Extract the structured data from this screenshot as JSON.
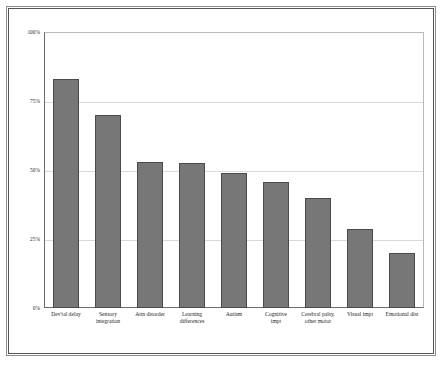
{
  "chart_data": {
    "type": "bar",
    "title": "",
    "subtitle": "",
    "xlabel": "",
    "ylabel": "",
    "ylim": [
      0,
      100
    ],
    "ytick_labels": [
      "100%",
      "75%",
      "50%",
      "25%",
      "0%"
    ],
    "ytick_values": [
      100,
      75,
      50,
      25,
      0
    ],
    "grid": true,
    "legend": "none",
    "bar_color": "#777777",
    "bar_border_color": "#4a4a4a",
    "plot_background": "#ffffff",
    "gridline_color": "#d9d9d9",
    "categories": [
      "Dev'tal delay",
      "Sensory integration",
      "Attn disorder",
      "Learning differences",
      "Autism",
      "Cognitive impt",
      "Cerebral palsy, other motor",
      "Visual impt",
      "Emotional dist"
    ],
    "values": [
      83,
      70,
      53,
      52.5,
      49,
      45.5,
      40,
      28.5,
      20
    ]
  },
  "axis": {
    "y_ticks": [
      {
        "label": "100%",
        "value": 100
      },
      {
        "label": "75%",
        "value": 75
      },
      {
        "label": "50%",
        "value": 50
      },
      {
        "label": "25%",
        "value": 25
      },
      {
        "label": "0%",
        "value": 0
      }
    ]
  },
  "xlabels": [
    {
      "line1": "Dev'tal delay",
      "line2": ""
    },
    {
      "line1": "Sensory",
      "line2": "integration"
    },
    {
      "line1": "Attn disorder",
      "line2": ""
    },
    {
      "line1": "Learning",
      "line2": "differences"
    },
    {
      "line1": "Autism",
      "line2": ""
    },
    {
      "line1": "Cognitive",
      "line2": "impt"
    },
    {
      "line1": "Cerebral palsy,",
      "line2": "other motor"
    },
    {
      "line1": "Visual impt",
      "line2": ""
    },
    {
      "line1": "Emotional dist",
      "line2": ""
    }
  ]
}
